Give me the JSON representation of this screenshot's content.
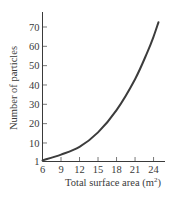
{
  "chart_data": {
    "type": "line",
    "title": "",
    "xlabel": "Total surface area (m²)",
    "ylabel": "Number of particles",
    "xlim": [
      6,
      25.5
    ],
    "ylim": [
      0,
      78
    ],
    "x_ticks": [
      6,
      9,
      12,
      15,
      18,
      21,
      24
    ],
    "y_ticks": [
      1,
      10,
      20,
      30,
      40,
      50,
      60,
      70
    ],
    "grid": false,
    "legend": null,
    "series": [
      {
        "name": "Number of particles",
        "x": [
          6,
          9,
          12,
          15,
          18,
          21,
          23,
          24,
          24.8
        ],
        "y": [
          1,
          4,
          8,
          15.5,
          27,
          43,
          57,
          65,
          72.5
        ]
      }
    ]
  },
  "labels": {
    "x_axis_title_main": "Total surface area (m",
    "x_axis_title_sup": "2",
    "x_axis_title_close": ")",
    "y_axis_title": "Number of particles"
  }
}
